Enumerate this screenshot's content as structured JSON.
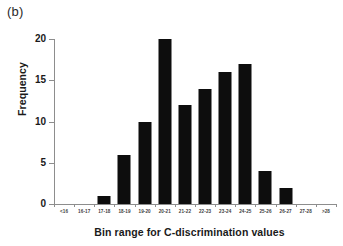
{
  "panel_label": "(b)",
  "chart_data": {
    "type": "bar",
    "title": "",
    "xlabel": "Bin range for C-discrimination values",
    "ylabel": "Frequency",
    "categories": [
      "<16",
      "16-17",
      "17-18",
      "18-19",
      "19-20",
      "20-21",
      "21-22",
      "22-23",
      "23-24",
      "24-25",
      "25-26",
      "26-27",
      "27-28",
      ">28"
    ],
    "values": [
      0,
      0,
      1,
      6,
      10,
      20,
      12,
      14,
      16,
      17,
      4,
      2,
      0,
      0
    ],
    "ylim": [
      0,
      20
    ],
    "yticks": [
      0,
      5,
      10,
      15,
      20
    ],
    "grid": false,
    "legend": null,
    "bar_color": "#0d0d0d",
    "axis_color": "#8d8d8d"
  }
}
